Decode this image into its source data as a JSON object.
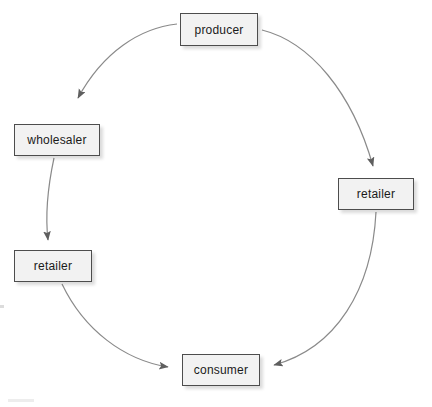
{
  "diagram": {
    "style": {
      "node_fill": "#f2f2f2",
      "node_border": "#4d4d4d",
      "arrow_color": "#7a7a7a",
      "text_color": "#1a1a1a",
      "background": "#ffffff"
    },
    "nodes": [
      {
        "id": "producer",
        "label": "producer"
      },
      {
        "id": "wholesaler",
        "label": "wholesaler"
      },
      {
        "id": "retailer-right",
        "label": "retailer"
      },
      {
        "id": "retailer-left",
        "label": "retailer"
      },
      {
        "id": "consumer",
        "label": "consumer"
      }
    ],
    "edges": [
      {
        "from": "producer",
        "to": "wholesaler",
        "shape": "curve"
      },
      {
        "from": "producer",
        "to": "retailer-right",
        "shape": "curve"
      },
      {
        "from": "wholesaler",
        "to": "retailer-left",
        "shape": "curve"
      },
      {
        "from": "retailer-left",
        "to": "consumer",
        "shape": "curve"
      },
      {
        "from": "retailer-right",
        "to": "consumer",
        "shape": "curve"
      }
    ]
  }
}
